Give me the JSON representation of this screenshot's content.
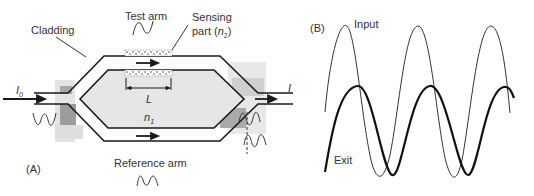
{
  "panel_a": {
    "label": "(A)",
    "cladding_label": "Cladding",
    "test_arm_label": "Test arm",
    "sensing_label_line1": "Sensing",
    "sensing_label_line2": "part (",
    "sensing_n": "n",
    "sensing_sub": "2",
    "sensing_close": ")",
    "input_intensity": "I",
    "input_intensity_sub": "0",
    "output_intensity": "I",
    "length_label": "L",
    "core_index": "n",
    "core_index_sub": "1",
    "reference_arm_label": "Reference arm"
  },
  "panel_b": {
    "label": "(B)",
    "input_label": "Input",
    "exit_label": "Exit"
  },
  "colors": {
    "line": "#1a1a1a",
    "cladding_fill": "#e6e6e6",
    "shade_dark": "#9a9a9a",
    "shade_light": "#d2d2d2"
  }
}
